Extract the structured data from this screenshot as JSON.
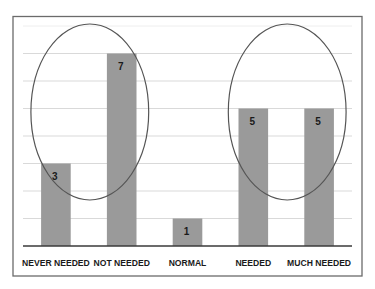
{
  "chart_data": {
    "type": "bar",
    "title": "",
    "xlabel": "",
    "ylabel": "",
    "categories": [
      "NEVER NEEDED",
      "NOT NEEDED",
      "NORMAL",
      "NEEDED",
      "MUCH NEEDED"
    ],
    "values": [
      3,
      7,
      1,
      5,
      5
    ],
    "data_labels": [
      "3",
      "7",
      "1",
      "5",
      "5"
    ],
    "ylim": [
      0,
      8
    ],
    "grid": true,
    "gridline_values": [
      1,
      2,
      3,
      4,
      5,
      6,
      7,
      8
    ],
    "y_tick_labels_shown": false,
    "legend": "none",
    "bar_color": "#9a9a9a",
    "annotations": [
      {
        "type": "ellipse",
        "encloses": [
          "NEVER NEEDED",
          "NOT NEEDED"
        ]
      },
      {
        "type": "ellipse",
        "encloses": [
          "NEEDED",
          "MUCH NEEDED"
        ]
      }
    ]
  }
}
